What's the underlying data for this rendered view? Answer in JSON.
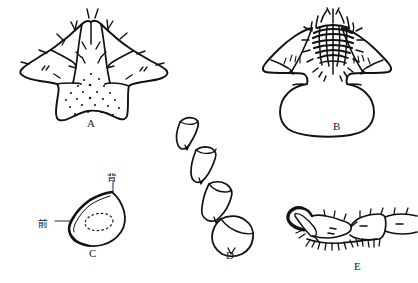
{
  "figure": {
    "type": "scientific-line-drawing-plate",
    "background_color": "#ffffff",
    "ink_color": "#111111",
    "panel_count": 5
  },
  "panels": [
    {
      "id": "A",
      "label": "A",
      "label_x": 90,
      "label_y": 123,
      "description": "dorsal view of head/pronotum sclerite with lateral lobes, marginal setae and stippled median area"
    },
    {
      "id": "B",
      "label": "B",
      "label_x": 336,
      "label_y": 126,
      "description": "dorsal view of sclerite with dense setose median patch and broad rounded posterior plate"
    },
    {
      "id": "C",
      "label": "C",
      "label_x": 92,
      "label_y": 253,
      "description": "cross section, teardrop outline with thickened anterior margin and dashed inner ellipse"
    },
    {
      "id": "D",
      "label": "D",
      "label_x": 229,
      "label_y": 255,
      "description": "chain of four articulated antennal or tarsal segments arranged diagonally"
    },
    {
      "id": "E",
      "label": "E",
      "label_x": 357,
      "label_y": 266,
      "description": "lateral view of tarsus with terminal claw and ventral setae"
    }
  ],
  "annotations": [
    {
      "panel": "C",
      "text": "背",
      "meaning": "dorsal",
      "x": 112,
      "y": 176,
      "leader": "vertical line down to top of outline"
    },
    {
      "panel": "C",
      "text": "前",
      "meaning": "anterior",
      "x": 42,
      "y": 222,
      "leader": "horizontal line right to thickened margin"
    }
  ]
}
